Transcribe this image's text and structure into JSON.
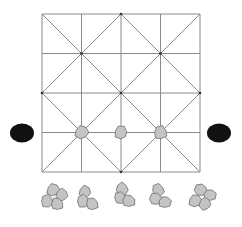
{
  "game": {
    "name": "board-game-diagram",
    "board": {
      "rows": 4,
      "cols": 4,
      "origin": [
        42,
        14
      ],
      "cell": 39.5,
      "line_color": "#8a8a8a",
      "diagonals": "alternating-star"
    },
    "colors": {
      "light_piece_fill": "#c4c4c4",
      "light_piece_stroke": "#6e6e6e",
      "dark_piece_fill": "#111111",
      "background": "#ffffff"
    },
    "points_on_board": [
      {
        "col": 1,
        "row": 3,
        "color": "light"
      },
      {
        "col": 2,
        "row": 3,
        "color": "light"
      },
      {
        "col": 3,
        "row": 3,
        "color": "light"
      }
    ],
    "side_pieces": [
      {
        "x": 22,
        "y": 133,
        "color": "dark",
        "side": "left"
      },
      {
        "x": 219,
        "y": 133,
        "color": "dark",
        "side": "right"
      }
    ],
    "reserve_piles": [
      {
        "cx": 56,
        "cy": 198,
        "count": 4
      },
      {
        "cx": 87,
        "cy": 198,
        "count": 3
      },
      {
        "cx": 124,
        "cy": 195,
        "count": 3
      },
      {
        "cx": 160,
        "cy": 196,
        "count": 3
      },
      {
        "cx": 204,
        "cy": 198,
        "count": 4
      }
    ]
  }
}
